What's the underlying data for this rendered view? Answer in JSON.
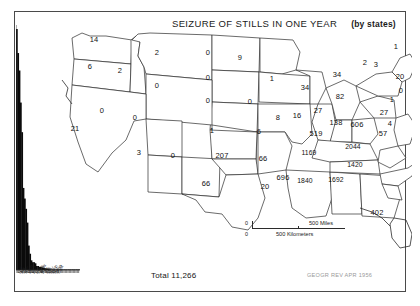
{
  "figure": {
    "title_main": "SEIZURE OF STILLS IN ONE YEAR",
    "title_sub": "(by states)",
    "total_label": "Total 11,266",
    "credit": "GEOGR REV  APR 1956"
  },
  "scale": {
    "miles_zero": "0",
    "miles_max": "500",
    "miles_unit": "500 Miles",
    "km_zero": "0",
    "km_unit": "500 Kilometers"
  },
  "chart_data": {
    "type": "bar",
    "xlabel": "",
    "ylabel": "",
    "grid": false,
    "legend": "none",
    "total": 11266,
    "note": "Choropleth-style map with per-state seizure counts, plus a ranked descending histogram of the same state values on the left.",
    "categories": [
      "NC",
      "AL",
      "GA",
      "SC",
      "TN",
      "MS",
      "VA",
      "KY",
      "FL",
      "OK",
      "WV",
      "PA",
      "TX",
      "AR",
      "MD",
      "NY",
      "MI",
      "NJ",
      "OH",
      "CA",
      "MA",
      "IN",
      "WA",
      "MN",
      "IL",
      "MO",
      "DE",
      "LA",
      "AZ",
      "MT",
      "ID",
      "OR",
      "NH",
      "VT",
      "ME",
      "CT",
      "KS",
      "WI",
      "CO",
      "IA",
      "NE",
      "NV",
      "NM",
      "ND",
      "SD",
      "UT",
      "WY",
      "RI"
    ],
    "values": [
      2044,
      1840,
      1692,
      1420,
      1169,
      696,
      606,
      519,
      402,
      207,
      138,
      82,
      66,
      66,
      57,
      34,
      34,
      27,
      27,
      21,
      20,
      16,
      14,
      9,
      8,
      6,
      4,
      4,
      3,
      2,
      2,
      6,
      3,
      2,
      1,
      1,
      1,
      1,
      0,
      0,
      0,
      0,
      0,
      0,
      0,
      0,
      0,
      0
    ],
    "ylim": [
      0,
      2100
    ],
    "histogram_profile": [
      2044,
      1840,
      1692,
      1420,
      1169,
      696,
      606,
      519,
      402,
      207,
      138,
      82,
      66,
      66,
      57,
      34,
      34,
      27,
      27,
      21,
      20,
      16,
      14,
      9,
      8,
      6,
      4,
      4,
      3,
      2,
      2,
      1,
      1,
      1,
      1,
      1,
      0,
      0,
      0,
      0,
      0,
      0,
      0,
      0,
      0,
      0,
      0,
      0
    ]
  },
  "states": [
    {
      "abbr": "WA",
      "value": "14",
      "x": 94,
      "y": 39
    },
    {
      "abbr": "OR",
      "value": "6",
      "x": 90,
      "y": 66
    },
    {
      "abbr": "ID",
      "value": "2",
      "x": 120,
      "y": 70
    },
    {
      "abbr": "MT",
      "value": "2",
      "x": 157,
      "y": 52
    },
    {
      "abbr": "ND",
      "value": "0",
      "x": 208,
      "y": 52
    },
    {
      "abbr": "SD",
      "value": "0",
      "x": 208,
      "y": 77
    },
    {
      "abbr": "NE",
      "value": "0",
      "x": 208,
      "y": 100
    },
    {
      "abbr": "WY",
      "value": "0",
      "x": 157,
      "y": 85
    },
    {
      "abbr": "NV",
      "value": "0",
      "x": 102,
      "y": 110
    },
    {
      "abbr": "UT",
      "value": "0",
      "x": 135,
      "y": 117
    },
    {
      "abbr": "CA",
      "value": "21",
      "x": 75,
      "y": 128
    },
    {
      "abbr": "AZ",
      "value": "3",
      "x": 139,
      "y": 152
    },
    {
      "abbr": "NM",
      "value": "0",
      "x": 173,
      "y": 155
    },
    {
      "abbr": "CO",
      "value": "0",
      "x": 0,
      "y": 0
    },
    {
      "abbr": "KS",
      "value": "1",
      "x": 212,
      "y": 130
    },
    {
      "abbr": "OK",
      "value": "207",
      "x": 222,
      "y": 155
    },
    {
      "abbr": "TX",
      "value": "66",
      "x": 206,
      "y": 183
    },
    {
      "abbr": "MN",
      "value": "9",
      "x": 240,
      "y": 57
    },
    {
      "abbr": "IA",
      "value": "0",
      "x": 250,
      "y": 101
    },
    {
      "abbr": "MO",
      "value": "6",
      "x": 259,
      "y": 131
    },
    {
      "abbr": "AR",
      "value": "66",
      "x": 263,
      "y": 158
    },
    {
      "abbr": "LA",
      "value": "20",
      "x": 265,
      "y": 186
    },
    {
      "abbr": "WI",
      "value": "1",
      "x": 272,
      "y": 78
    },
    {
      "abbr": "IL",
      "value": "8",
      "x": 278,
      "y": 117
    },
    {
      "abbr": "MS",
      "value": "696",
      "x": 283,
      "y": 177
    },
    {
      "abbr": "MI",
      "value": "34",
      "x": 305,
      "y": 87
    },
    {
      "abbr": "IN",
      "value": "16",
      "x": 297,
      "y": 115
    },
    {
      "abbr": "AL",
      "value": "1840",
      "x": 305,
      "y": 180
    },
    {
      "abbr": "KY",
      "value": "519",
      "x": 316,
      "y": 133
    },
    {
      "abbr": "TN",
      "value": "1169",
      "x": 309,
      "y": 152
    },
    {
      "abbr": "GA",
      "value": "1692",
      "x": 336,
      "y": 179
    },
    {
      "abbr": "OH",
      "value": "27",
      "x": 318,
      "y": 110
    },
    {
      "abbr": "WV",
      "value": "138",
      "x": 336,
      "y": 122
    },
    {
      "abbr": "VA",
      "value": "606",
      "x": 357,
      "y": 124
    },
    {
      "abbr": "NC",
      "value": "2044",
      "x": 353,
      "y": 146
    },
    {
      "abbr": "SC",
      "value": "1420",
      "x": 355,
      "y": 164
    },
    {
      "abbr": "FL",
      "value": "402",
      "x": 377,
      "y": 212
    },
    {
      "abbr": "PA",
      "value": "82",
      "x": 340,
      "y": 96
    },
    {
      "abbr": "NY",
      "value": "34",
      "x": 337,
      "y": 74
    },
    {
      "abbr": "ME",
      "value": "1",
      "x": 396,
      "y": 46
    },
    {
      "abbr": "VT",
      "value": "2",
      "x": 365,
      "y": 62
    },
    {
      "abbr": "NH",
      "value": "3",
      "x": 376,
      "y": 64
    },
    {
      "abbr": "MA",
      "value": "20",
      "x": 400,
      "y": 76
    },
    {
      "abbr": "RI",
      "value": "0",
      "x": 401,
      "y": 90
    },
    {
      "abbr": "CT",
      "value": "1",
      "x": 392,
      "y": 99
    },
    {
      "abbr": "NJ",
      "value": "27",
      "x": 384,
      "y": 112
    },
    {
      "abbr": "DE",
      "value": "4",
      "x": 390,
      "y": 123
    },
    {
      "abbr": "MD",
      "value": "57",
      "x": 383,
      "y": 133
    }
  ],
  "hist_labels": [
    "N.C",
    "Ala",
    "Ga",
    "S.C",
    "Tenn",
    "Miss",
    "Va",
    "Ky",
    "Fla",
    "Okla",
    "W.Va",
    "Pa",
    "Tex",
    "Ark",
    "Md",
    "N.Y",
    "Mich",
    "N.J",
    "Ohio",
    "Calif"
  ]
}
